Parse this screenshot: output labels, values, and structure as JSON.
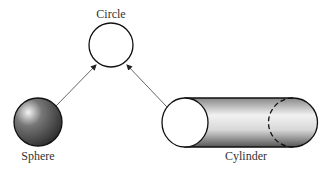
{
  "labels": {
    "circle": "Circle",
    "sphere": "Sphere",
    "cylinder": "Cylinder"
  },
  "nodes": [
    {
      "id": "circle",
      "label": "Circle",
      "shape": "circle"
    },
    {
      "id": "sphere",
      "label": "Sphere",
      "shape": "sphere"
    },
    {
      "id": "cylinder",
      "label": "Cylinder",
      "shape": "cylinder"
    }
  ],
  "edges": [
    {
      "from": "sphere",
      "to": "circle"
    },
    {
      "from": "cylinder",
      "to": "circle"
    }
  ],
  "colors": {
    "stroke": "#111111",
    "arrow": "#666666"
  }
}
